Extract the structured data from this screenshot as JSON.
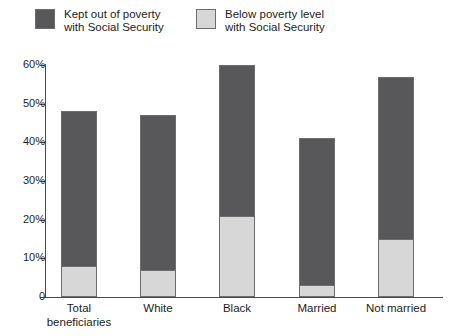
{
  "chart_data": {
    "type": "bar",
    "subtype": "stacked-vertical",
    "title": "",
    "xlabel": "",
    "ylabel": "",
    "ylim": [
      0,
      60
    ],
    "ytick_values": [
      0,
      10,
      20,
      30,
      40,
      50,
      60
    ],
    "ytick_labels": [
      "0",
      "10%",
      "20%",
      "30%",
      "40%",
      "50%",
      "60%"
    ],
    "grid": false,
    "legend_position": "top-left",
    "categories": [
      "Total beneficiaries",
      "White",
      "Black",
      "Married",
      "Not married"
    ],
    "category_lines": [
      [
        "Total",
        "beneficiaries"
      ],
      [
        "White",
        ""
      ],
      [
        "Black",
        ""
      ],
      [
        "Married",
        ""
      ],
      [
        "Not married",
        ""
      ]
    ],
    "series": [
      {
        "name": "Below poverty level with Social Security",
        "legend_lines": [
          "Below poverty level",
          "with Social Security"
        ],
        "color": "#d7d7d7",
        "stack_order": 0,
        "values": [
          8,
          7,
          21,
          3,
          15
        ]
      },
      {
        "name": "Kept out of poverty with Social Security",
        "legend_lines": [
          "Kept out of poverty",
          "with Social Security"
        ],
        "color": "#58585a",
        "stack_order": 1,
        "values": [
          40,
          40,
          39,
          38,
          42
        ]
      }
    ],
    "totals": [
      48,
      47,
      60,
      41,
      57
    ]
  },
  "style": {
    "dark_color": "#58585a",
    "light_color": "#d7d7d7",
    "border_color": "#6d6d6d",
    "axis_color": "#4a4a4a",
    "text_color": "#1d1d1d",
    "background": "#ffffff"
  }
}
